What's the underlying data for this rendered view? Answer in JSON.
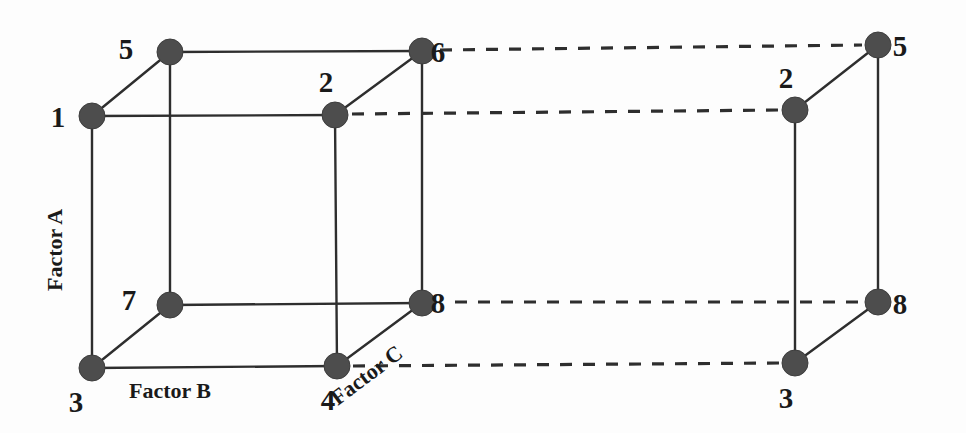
{
  "figure": {
    "background_color": "#fdfdfd",
    "node_color": "#4d4d4d",
    "line_color": "#2e2e2e"
  },
  "axes": [
    {
      "key": "factor_a",
      "label": "Factor A",
      "orientation": "vertical",
      "rotation_deg": -90,
      "x": 62,
      "y": 250
    },
    {
      "key": "factor_b",
      "label": "Factor B",
      "orientation": "horizontal",
      "rotation_deg": 0,
      "x": 170,
      "y": 398
    },
    {
      "key": "factor_c",
      "label": "Factor C",
      "orientation": "diagonal",
      "rotation_deg": -37,
      "x": 371,
      "y": 381
    }
  ],
  "cube_left": {
    "name": "left-cube",
    "vertices": [
      {
        "id": "L1",
        "label": "1",
        "cx": 92,
        "cy": 116,
        "label_x": 58,
        "label_y": 127
      },
      {
        "id": "L5",
        "label": "5",
        "cx": 170,
        "cy": 52,
        "label_x": 126,
        "label_y": 59
      },
      {
        "id": "L2",
        "label": "2",
        "cx": 335,
        "cy": 115,
        "label_x": 326,
        "label_y": 92
      },
      {
        "id": "L6",
        "label": "6",
        "cx": 422,
        "cy": 51,
        "label_x": 438,
        "label_y": 62
      },
      {
        "id": "L3",
        "label": "3",
        "cx": 92,
        "cy": 368,
        "label_x": 76,
        "label_y": 412
      },
      {
        "id": "L7",
        "label": "7",
        "cx": 170,
        "cy": 305,
        "label_x": 129,
        "label_y": 310
      },
      {
        "id": "L4",
        "label": "4",
        "cx": 337,
        "cy": 366,
        "label_x": 328,
        "label_y": 410
      },
      {
        "id": "L8",
        "label": "8",
        "cx": 422,
        "cy": 303,
        "label_x": 438,
        "label_y": 313
      }
    ],
    "edges": [
      {
        "from": "L1",
        "to": "L5",
        "style": "solid"
      },
      {
        "from": "L5",
        "to": "L6",
        "style": "solid"
      },
      {
        "from": "L2",
        "to": "L6",
        "style": "solid"
      },
      {
        "from": "L1",
        "to": "L2",
        "style": "solid"
      },
      {
        "from": "L1",
        "to": "L3",
        "style": "solid"
      },
      {
        "from": "L5",
        "to": "L7",
        "style": "solid"
      },
      {
        "from": "L2",
        "to": "L4",
        "style": "solid"
      },
      {
        "from": "L6",
        "to": "L8",
        "style": "solid"
      },
      {
        "from": "L3",
        "to": "L7",
        "style": "solid"
      },
      {
        "from": "L7",
        "to": "L8",
        "style": "solid"
      },
      {
        "from": "L4",
        "to": "L8",
        "style": "solid"
      },
      {
        "from": "L3",
        "to": "L4",
        "style": "solid"
      }
    ]
  },
  "cube_right": {
    "name": "right-cube",
    "vertices": [
      {
        "id": "R5",
        "label": "5",
        "cx": 878,
        "cy": 45,
        "label_x": 900,
        "label_y": 56
      },
      {
        "id": "R2",
        "label": "2",
        "cx": 795,
        "cy": 110,
        "label_x": 786,
        "label_y": 88
      },
      {
        "id": "R8",
        "label": "8",
        "cx": 878,
        "cy": 302,
        "label_x": 900,
        "label_y": 314
      },
      {
        "id": "R3",
        "label": "3",
        "cx": 795,
        "cy": 363,
        "label_x": 786,
        "label_y": 408
      }
    ],
    "edges": [
      {
        "from": "R2",
        "to": "R5",
        "style": "solid"
      },
      {
        "from": "R5",
        "to": "R8",
        "style": "solid"
      },
      {
        "from": "R2",
        "to": "R3",
        "style": "solid"
      },
      {
        "from": "R3",
        "to": "R8",
        "style": "solid"
      }
    ]
  },
  "connectors": [
    {
      "name": "connector-6-to-5",
      "from": "L6",
      "to": "R5",
      "style": "dashed",
      "x1": 440,
      "y1": 50,
      "x2": 862,
      "y2": 45
    },
    {
      "name": "connector-2-to-2",
      "from": "L2",
      "to": "R2",
      "style": "dashed",
      "x1": 352,
      "y1": 114,
      "x2": 780,
      "y2": 110
    },
    {
      "name": "connector-8-to-8",
      "from": "L8",
      "to": "R8",
      "style": "dashed",
      "x1": 455,
      "y1": 302,
      "x2": 862,
      "y2": 302
    },
    {
      "name": "connector-4-to-3",
      "from": "L4",
      "to": "R3",
      "style": "dashed",
      "x1": 353,
      "y1": 366,
      "x2": 780,
      "y2": 363
    }
  ],
  "node_radius": 13
}
